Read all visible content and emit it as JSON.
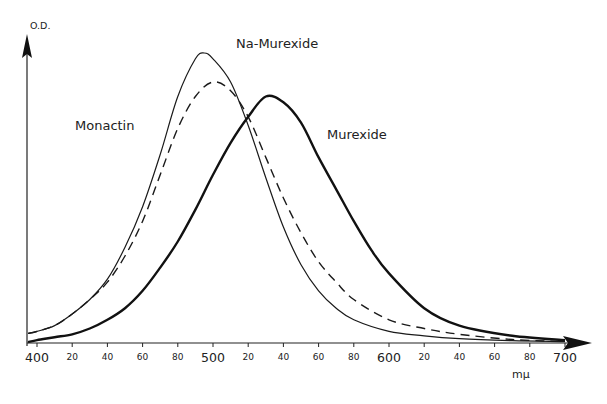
{
  "chart_data": {
    "type": "line",
    "title": "",
    "xlabel": "mμ",
    "ylabel": "O.D.",
    "xlim": [
      394,
      712
    ],
    "ylim": [
      0,
      1.05
    ],
    "grid": false,
    "legend": "inline labels",
    "x_tick_values": [
      400,
      420,
      440,
      460,
      480,
      500,
      520,
      540,
      560,
      580,
      600,
      620,
      640,
      660,
      680,
      700
    ],
    "x_tick_labels": [
      "400",
      "20",
      "40",
      "60",
      "80",
      "500",
      "20",
      "40",
      "60",
      "80",
      "600",
      "20",
      "40",
      "60",
      "80",
      "700"
    ],
    "x_major_ticks": [
      "400",
      "500",
      "600",
      "700"
    ],
    "series": [
      {
        "name": "Monactin",
        "style": "thin-solid",
        "label_pos": [
          75,
          118
        ],
        "x": [
          400,
          410,
          420,
          430,
          440,
          450,
          460,
          470,
          480,
          490,
          495,
          500,
          510,
          520,
          530,
          540,
          550,
          560,
          570,
          580,
          600,
          620,
          640,
          670,
          700
        ],
        "values": [
          0.04,
          0.06,
          0.1,
          0.15,
          0.22,
          0.33,
          0.47,
          0.65,
          0.85,
          0.98,
          1.0,
          0.98,
          0.9,
          0.75,
          0.57,
          0.4,
          0.27,
          0.18,
          0.12,
          0.08,
          0.04,
          0.025,
          0.015,
          0.008,
          0.005
        ]
      },
      {
        "name": "Na-Murexide",
        "style": "dashed",
        "label_pos": [
          236,
          36
        ],
        "x": [
          400,
          410,
          420,
          430,
          440,
          450,
          460,
          470,
          480,
          490,
          500,
          510,
          520,
          530,
          540,
          550,
          560,
          570,
          580,
          600,
          620,
          640,
          670,
          700
        ],
        "values": [
          0.04,
          0.06,
          0.1,
          0.15,
          0.21,
          0.3,
          0.42,
          0.58,
          0.74,
          0.85,
          0.9,
          0.87,
          0.78,
          0.64,
          0.5,
          0.38,
          0.28,
          0.21,
          0.15,
          0.08,
          0.05,
          0.03,
          0.012,
          0.005
        ]
      },
      {
        "name": "Murexide",
        "style": "thick-solid",
        "label_pos": [
          327,
          127
        ],
        "x": [
          400,
          410,
          420,
          430,
          440,
          450,
          460,
          470,
          480,
          490,
          500,
          510,
          520,
          530,
          540,
          550,
          560,
          570,
          580,
          590,
          600,
          620,
          640,
          670,
          700
        ],
        "values": [
          0.01,
          0.02,
          0.03,
          0.05,
          0.08,
          0.12,
          0.18,
          0.26,
          0.35,
          0.46,
          0.58,
          0.69,
          0.78,
          0.85,
          0.83,
          0.76,
          0.64,
          0.53,
          0.42,
          0.32,
          0.24,
          0.12,
          0.06,
          0.025,
          0.01
        ]
      }
    ]
  },
  "axes": {
    "y_title": "O.D.",
    "x_unit": "mμ"
  }
}
